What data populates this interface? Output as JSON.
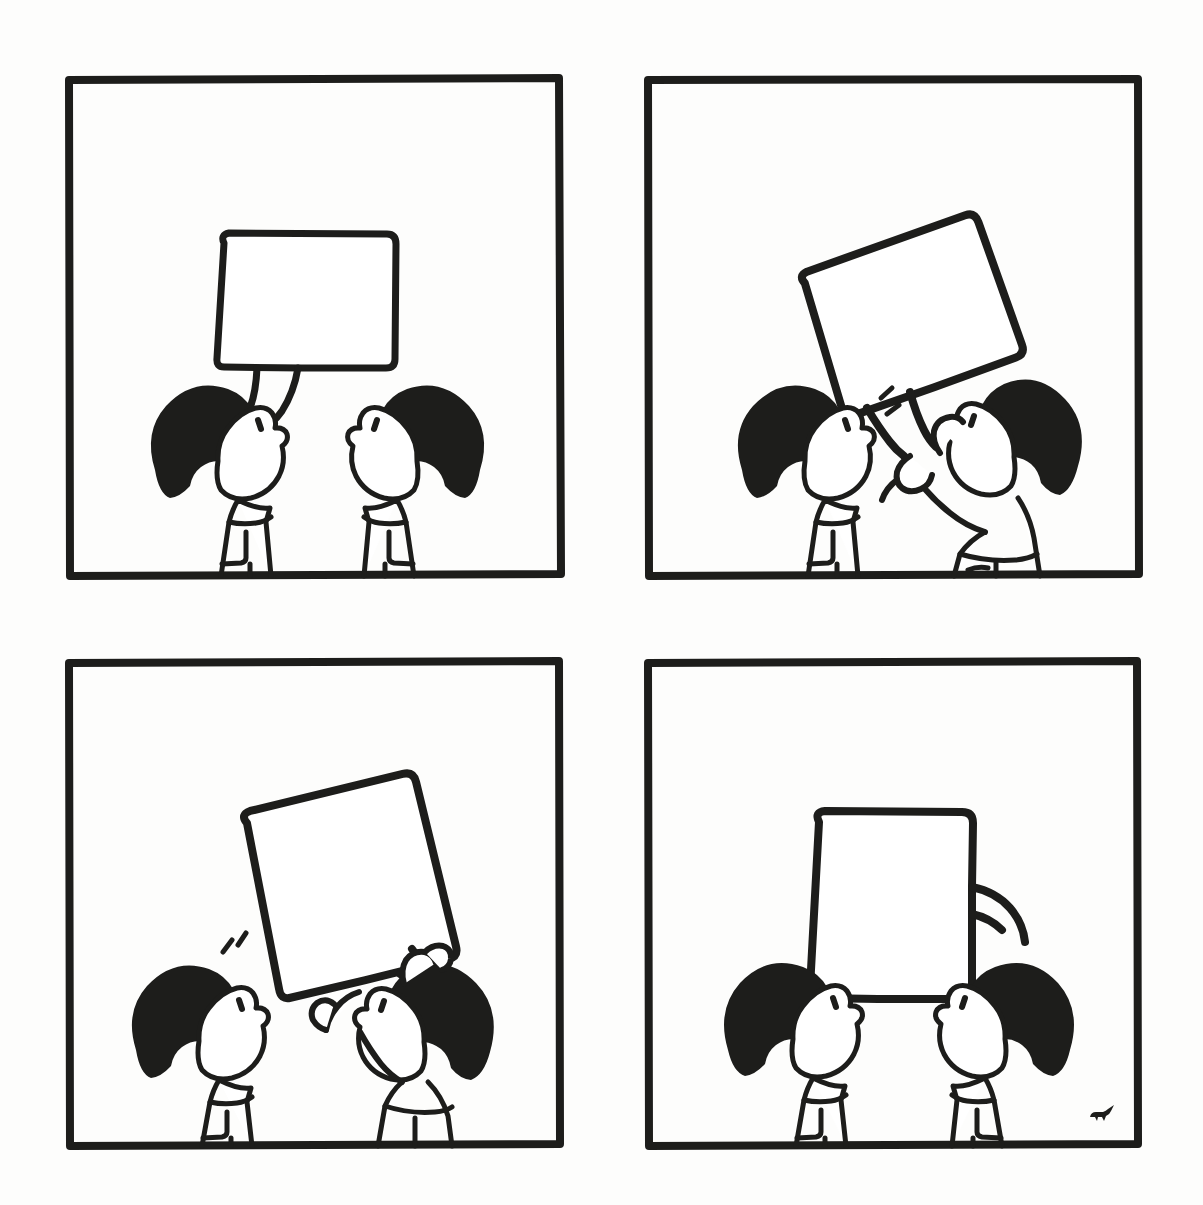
{
  "artwork": {
    "title": "Four-panel wordless comic: the speech bubble is taken away",
    "format": "2x2 comic grid",
    "background_color": "#fdfdfc",
    "ink_color": "#1d1d1b",
    "hair_fill_color": "#1d1d1b",
    "bubble_fill_color": "#ffffff",
    "canvas": {
      "width": 1203,
      "height": 1205
    }
  },
  "panels": [
    {
      "id": "panel-1",
      "index": 1,
      "position": "top-left",
      "caption": "Left character speaks; an empty speech bubble with a curling tail floats between the two characters.",
      "frame": {
        "x": 68,
        "y": 79,
        "width": 492,
        "height": 496
      },
      "speech_bubble": {
        "state": "attached-to-speaker",
        "rotation_deg": 0,
        "tail": "curled-tail-down-left",
        "text": "",
        "box": {
          "x": 218,
          "y": 233,
          "width": 172,
          "height": 130
        }
      },
      "characters": [
        {
          "name": "left-character",
          "role": "speaker",
          "facing": "right",
          "hair": "black-bob",
          "pose": "standing, looking up"
        },
        {
          "name": "right-character",
          "role": "listener",
          "facing": "left",
          "hair": "black-bob",
          "pose": "standing, looking up"
        }
      ],
      "effect_lines": 0
    },
    {
      "id": "panel-2",
      "index": 2,
      "position": "top-right",
      "caption": "The right character grabs the speech bubble by its tail and pulls it away; small motion lines burst from the speaker's mouth.",
      "frame": {
        "x": 648,
        "y": 79,
        "width": 490,
        "height": 496
      },
      "speech_bubble": {
        "state": "being-pulled-away",
        "rotation_deg": -20,
        "tail": "pinched-in-hands",
        "text": "",
        "box": {
          "x": 818,
          "y": 248,
          "width": 190,
          "height": 142
        }
      },
      "characters": [
        {
          "name": "left-character",
          "role": "speaker",
          "facing": "right",
          "hair": "black-bob",
          "pose": "standing, mouth open"
        },
        {
          "name": "right-character",
          "role": "bubble-thief",
          "facing": "left",
          "hair": "black-bob",
          "pose": "both arms raised, gripping the bubble tail"
        }
      ],
      "effect_lines": 2
    },
    {
      "id": "panel-3",
      "index": 3,
      "position": "bottom-left",
      "caption": "The right character lifts the bubble higher with both hands, tilting it upright; motion lines still near the speaker.",
      "frame": {
        "x": 68,
        "y": 661,
        "width": 492,
        "height": 485
      },
      "speech_bubble": {
        "state": "lifted-overhead",
        "rotation_deg": -14,
        "tail": "gripped-at-lower-right",
        "text": "",
        "box": {
          "x": 258,
          "y": 790,
          "width": 172,
          "height": 178
        }
      },
      "characters": [
        {
          "name": "left-character",
          "role": "speaker",
          "facing": "right",
          "hair": "black-bob",
          "pose": "standing, watching"
        },
        {
          "name": "right-character",
          "role": "bubble-thief",
          "facing": "left",
          "hair": "black-bob",
          "pose": "reaching up with both arms"
        }
      ],
      "effect_lines": 2
    },
    {
      "id": "panel-4",
      "index": 4,
      "position": "bottom-right",
      "caption": "The bubble now hangs upright above the right character, its tail curling toward them; both characters look up at it.",
      "frame": {
        "x": 648,
        "y": 661,
        "width": 488,
        "height": 485
      },
      "speech_bubble": {
        "state": "reassigned-to-right-character",
        "rotation_deg": 0,
        "tail": "curled-tail-down-right",
        "text": "",
        "box": {
          "x": 819,
          "y": 813,
          "width": 152,
          "height": 178
        }
      },
      "characters": [
        {
          "name": "left-character",
          "role": "listener",
          "facing": "right",
          "hair": "black-bob",
          "pose": "standing, looking up"
        },
        {
          "name": "right-character",
          "role": "new-speaker",
          "facing": "left",
          "hair": "black-bob",
          "pose": "standing, looking up"
        }
      ],
      "effect_lines": 0,
      "signature": {
        "present": true,
        "label": "artist-signature-mark",
        "description": "small black brush mark resembling a tiny animal",
        "x": 1104,
        "y": 1122
      }
    }
  ]
}
